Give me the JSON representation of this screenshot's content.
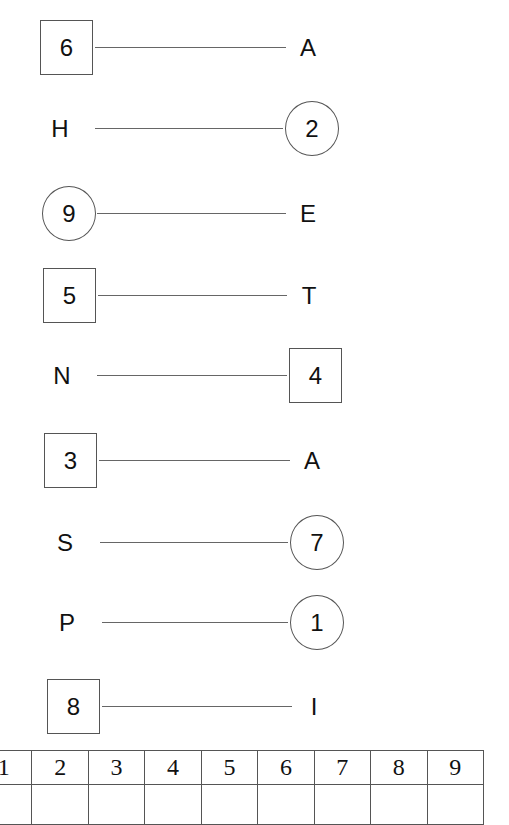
{
  "pairs": [
    {
      "left": {
        "text": "6",
        "shape": "box"
      },
      "right": {
        "text": "A",
        "shape": "none"
      }
    },
    {
      "left": {
        "text": "H",
        "shape": "none"
      },
      "right": {
        "text": "2",
        "shape": "circle"
      }
    },
    {
      "left": {
        "text": "9",
        "shape": "circle"
      },
      "right": {
        "text": "E",
        "shape": "none"
      }
    },
    {
      "left": {
        "text": "5",
        "shape": "box"
      },
      "right": {
        "text": "T",
        "shape": "none"
      }
    },
    {
      "left": {
        "text": "N",
        "shape": "none"
      },
      "right": {
        "text": "4",
        "shape": "box"
      }
    },
    {
      "left": {
        "text": "3",
        "shape": "box"
      },
      "right": {
        "text": "A",
        "shape": "none"
      }
    },
    {
      "left": {
        "text": "S",
        "shape": "none"
      },
      "right": {
        "text": "7",
        "shape": "circle"
      }
    },
    {
      "left": {
        "text": "P",
        "shape": "none"
      },
      "right": {
        "text": "1",
        "shape": "circle"
      }
    },
    {
      "left": {
        "text": "8",
        "shape": "box"
      },
      "right": {
        "text": "I",
        "shape": "none"
      }
    }
  ],
  "answer_table": {
    "headers": [
      "1",
      "2",
      "3",
      "4",
      "5",
      "6",
      "7",
      "8",
      "9"
    ],
    "answers": [
      "",
      "",
      "",
      "",
      "",
      "",
      "",
      "",
      ""
    ]
  }
}
